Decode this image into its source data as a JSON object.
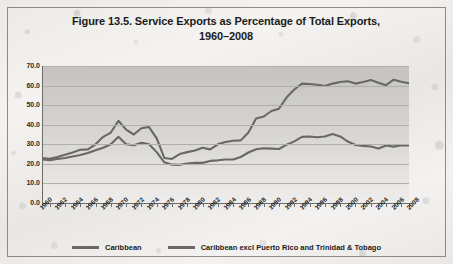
{
  "figure": {
    "title_line1": "Figure 13.5. Service Exports as Percentage of Total Exports,",
    "title_line2": "1960–2008"
  },
  "legend": {
    "items": [
      {
        "label": "Caribbean",
        "color": "#6a6865"
      },
      {
        "label": "Caribbean excl Puerto Rico and Trinidad & Tobago",
        "color": "#6a6865"
      }
    ]
  },
  "chart_data": {
    "type": "line",
    "title": "Figure 13.5. Service Exports as Percentage of Total Exports, 1960–2008",
    "xlabel": "",
    "ylabel": "",
    "ylim": [
      0.0,
      70.0
    ],
    "yticks": [
      "0.0",
      "10.0",
      "20.0",
      "30.0",
      "40.0",
      "50.0",
      "60.0",
      "70.0"
    ],
    "ytick_values": [
      0.0,
      10.0,
      20.0,
      30.0,
      40.0,
      50.0,
      60.0,
      70.0
    ],
    "xlim": [
      1960,
      2008
    ],
    "xtick_labels": [
      "1960",
      "1962",
      "1964",
      "1966",
      "1968",
      "1970",
      "1972",
      "1974",
      "1976",
      "1978",
      "1980",
      "1982",
      "1984",
      "1986",
      "1988",
      "1990",
      "1992",
      "1994",
      "1996",
      "1998",
      "2000",
      "2002",
      "2004",
      "2006",
      "2008"
    ],
    "grid": "horizontal",
    "legend_position": "bottom",
    "x": [
      1960,
      1961,
      1962,
      1963,
      1964,
      1965,
      1966,
      1967,
      1968,
      1969,
      1970,
      1971,
      1972,
      1973,
      1974,
      1975,
      1976,
      1977,
      1978,
      1979,
      1980,
      1981,
      1982,
      1983,
      1984,
      1985,
      1986,
      1987,
      1988,
      1989,
      1990,
      1991,
      1992,
      1993,
      1994,
      1995,
      1996,
      1997,
      1998,
      1999,
      2000,
      2001,
      2002,
      2003,
      2004,
      2005,
      2006,
      2007,
      2008
    ],
    "series": [
      {
        "name": "Caribbean",
        "color": "#6a6865",
        "values": [
          23.0,
          22.6,
          23.5,
          24.6,
          25.8,
          27.2,
          27.4,
          30.0,
          33.8,
          36.0,
          42.0,
          37.5,
          35.0,
          38.2,
          38.8,
          33.0,
          23.0,
          22.5,
          25.0,
          26.0,
          26.8,
          28.2,
          27.4,
          30.0,
          31.2,
          31.8,
          32.0,
          36.0,
          43.2,
          44.2,
          47.0,
          48.2,
          54.0,
          58.0,
          61.0,
          60.8,
          60.4,
          59.8,
          61.0,
          61.8,
          62.2,
          61.0,
          61.8,
          62.8,
          61.5,
          60.2,
          63.0,
          62.0,
          61.2
        ]
      },
      {
        "name": "Caribbean excl Puerto Rico and Trinidad & Tobago",
        "color": "#6a6865",
        "values": [
          22.2,
          21.9,
          22.5,
          23.0,
          23.8,
          24.5,
          25.5,
          27.0,
          28.2,
          30.0,
          33.8,
          30.0,
          29.5,
          30.8,
          30.0,
          26.0,
          20.8,
          19.6,
          19.5,
          20.2,
          20.6,
          20.5,
          21.5,
          21.8,
          22.2,
          22.2,
          23.5,
          25.8,
          27.5,
          28.0,
          27.8,
          27.6,
          29.8,
          31.5,
          33.8,
          34.0,
          33.6,
          34.0,
          35.2,
          34.0,
          31.4,
          29.6,
          29.2,
          28.9,
          27.8,
          29.4,
          28.8,
          29.5,
          29.4
        ]
      }
    ]
  }
}
